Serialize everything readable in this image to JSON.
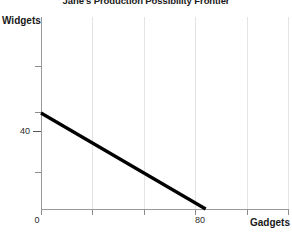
{
  "chart_data": {
    "type": "line",
    "title": "Jane's Production Possibility Frontier",
    "xlabel": "Gadgets",
    "ylabel": "Widgets",
    "xlim": [
      0,
      120
    ],
    "ylim": [
      0,
      80
    ],
    "grid": true,
    "legend": false,
    "x_tick_labels": [
      "0",
      "80"
    ],
    "y_tick_labels": [
      "40"
    ],
    "series": [
      {
        "name": "Production Possibility Frontier",
        "color": "#000000",
        "x": [
          0,
          80
        ],
        "y": [
          40,
          0
        ],
        "points": [
          {
            "gadgets": 0,
            "widgets": 40
          },
          {
            "gadgets": 80,
            "widgets": 0
          }
        ]
      }
    ],
    "annotations": {
      "y_intercept": 40,
      "x_intercept": 80,
      "slope": -0.5
    }
  },
  "axis": {
    "y_label": "Widgets",
    "x_label": "Gadgets",
    "y_tick_40": "40",
    "x_tick_0": "0",
    "x_tick_80": "80"
  },
  "title": {
    "text": "Jane's Production Possibility Frontier"
  },
  "colors": {
    "line": "#000000",
    "grid": "#e4e4e4",
    "axis": "#999999",
    "text": "#1a1a1a",
    "background": "#ffffff"
  }
}
